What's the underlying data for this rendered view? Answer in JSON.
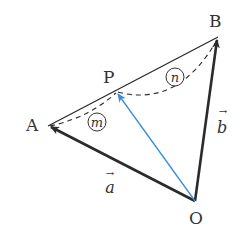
{
  "diagram": {
    "type": "vector-triangle",
    "points": {
      "O": {
        "label": "O",
        "x": 195,
        "y": 201
      },
      "A": {
        "label": "A",
        "x": 48,
        "y": 126
      },
      "B": {
        "label": "B",
        "x": 218,
        "y": 37
      },
      "P": {
        "label": "P",
        "x": 116,
        "y": 91
      }
    },
    "vectors": {
      "a": {
        "label": "a",
        "arrow": "→",
        "from": "O",
        "to": "A"
      },
      "b": {
        "label": "b",
        "arrow": "→",
        "from": "O",
        "to": "B"
      },
      "OP": {
        "from": "O",
        "to": "P",
        "color": "#3a8ed8"
      }
    },
    "segment_ratio": {
      "AP": {
        "label": "m"
      },
      "PB": {
        "label": "n"
      }
    },
    "colors": {
      "stroke": "#2b2b2b",
      "blue": "#3a8ed8",
      "text": "#333333"
    }
  }
}
